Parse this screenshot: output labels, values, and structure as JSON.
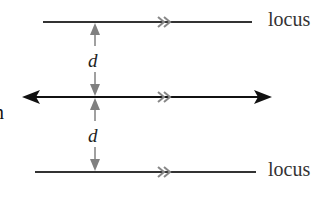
{
  "diagram": {
    "labels": {
      "top_locus": "locus",
      "bottom_locus": "locus",
      "distance_top": "d",
      "distance_bottom": "d",
      "left_partial": "n"
    },
    "colors": {
      "line": "#333333",
      "main_line": "#111111",
      "distance_arrow": "#808080",
      "parallel_mark": "#888888"
    },
    "elements": [
      {
        "id": "top-locus-line",
        "type": "line",
        "parallel_mark": ">>"
      },
      {
        "id": "given-line",
        "type": "double-arrow-line",
        "parallel_mark": ">>"
      },
      {
        "id": "bottom-locus-line",
        "type": "line",
        "parallel_mark": ">>"
      }
    ]
  }
}
